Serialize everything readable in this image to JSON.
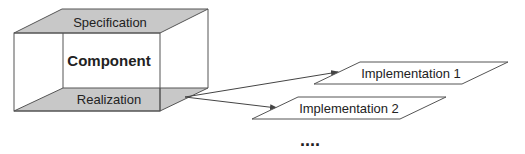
{
  "component": {
    "title": "Component",
    "top_face_label": "Specification",
    "bottom_face_label": "Realization"
  },
  "implementations": [
    {
      "label": "Implementation 1"
    },
    {
      "label": "Implementation 2"
    }
  ],
  "ellipsis": "....",
  "colors": {
    "face_fill": "#c8c8c8",
    "stroke": "#555555",
    "background": "#ffffff"
  }
}
